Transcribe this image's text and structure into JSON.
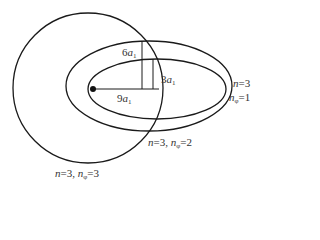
{
  "diagram": {
    "type": "bohr-sommerfeld-orbits",
    "stroke_color": "#1a1a1a",
    "label_color": "#333333",
    "nucleus": {
      "cx": 93,
      "cy": 89,
      "r": 3
    },
    "orbits": [
      {
        "name": "circle-n3-nphi3",
        "shape": "circle",
        "cx": 88,
        "cy": 88,
        "rx": 75,
        "ry": 75,
        "label": {
          "n": "3",
          "nphi": "3",
          "text": "n=3, n_φ=3"
        }
      },
      {
        "name": "ellipse-n3-nphi2",
        "shape": "ellipse",
        "cx": 149,
        "cy": 86,
        "rx": 83,
        "ry": 45,
        "label": {
          "n": "3",
          "nphi": "2",
          "text": "n=3, n_φ=2"
        }
      },
      {
        "name": "ellipse-n3-nphi1",
        "shape": "ellipse",
        "cx": 157,
        "cy": 89,
        "rx": 69,
        "ry": 30,
        "label": {
          "n": "3",
          "nphi": "1",
          "text": "n=3, n_φ=1"
        }
      }
    ],
    "dimensions": {
      "semi_major": {
        "text": "9",
        "unit": "a",
        "sub": "1"
      },
      "semi_minor_outer": {
        "text": "6",
        "unit": "a",
        "sub": "1"
      },
      "semi_minor_inner": {
        "text": "3",
        "unit": "a",
        "sub": "1"
      }
    },
    "symbols": {
      "n": "n",
      "eq": "=",
      "comma": ",",
      "phi": "φ"
    }
  }
}
